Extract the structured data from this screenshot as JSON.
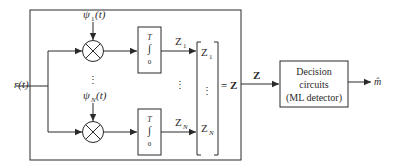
{
  "diagram": {
    "type": "correlation-receiver-block-diagram",
    "input": {
      "label": "r(t)"
    },
    "branches": [
      {
        "basis_label": "ψ",
        "basis_sub": "1",
        "basis_arg": "(t)",
        "integrator_upper": "T",
        "integrator_symbol": "∫",
        "integrator_lower": "0",
        "output": "Z",
        "output_sub": "1"
      },
      {
        "basis_label": "ψ",
        "basis_sub": "N",
        "basis_arg": "(t)",
        "integrator_upper": "T",
        "integrator_symbol": "∫",
        "integrator_lower": "0",
        "output": "Z",
        "output_sub": "N"
      }
    ],
    "ellipsis": "⋮",
    "vector": {
      "entries": [
        {
          "base": "Z",
          "sub": "1"
        },
        {
          "base": "Z",
          "sub": "N"
        }
      ],
      "equals_label": "= Z"
    },
    "link_label": "Z",
    "decision_block": {
      "lines": [
        "Decision",
        "circuits",
        "(ML detector)"
      ]
    },
    "output": {
      "label": "m̂"
    },
    "colors": {
      "stroke": "#2a2a2a",
      "background": "#ffffff"
    }
  }
}
